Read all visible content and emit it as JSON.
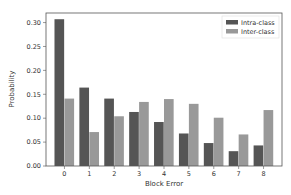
{
  "chart_data": {
    "type": "bar",
    "title": "",
    "xlabel": "Block Error",
    "ylabel": "Probability",
    "categories": [
      "0",
      "1",
      "2",
      "3",
      "4",
      "5",
      "6",
      "7",
      "8"
    ],
    "series": [
      {
        "name": "Intra-class",
        "color": "#555555",
        "values": [
          0.307,
          0.164,
          0.141,
          0.113,
          0.092,
          0.068,
          0.048,
          0.031,
          0.043
        ]
      },
      {
        "name": "Inter-class",
        "color": "#999999",
        "values": [
          0.141,
          0.071,
          0.104,
          0.134,
          0.14,
          0.13,
          0.101,
          0.066,
          0.117
        ]
      }
    ],
    "ylim": [
      0,
      0.32
    ],
    "yticks": [
      "0.00",
      "0.05",
      "0.10",
      "0.15",
      "0.20",
      "0.25",
      "0.30"
    ],
    "grid": false,
    "legend_position": "top-right"
  }
}
